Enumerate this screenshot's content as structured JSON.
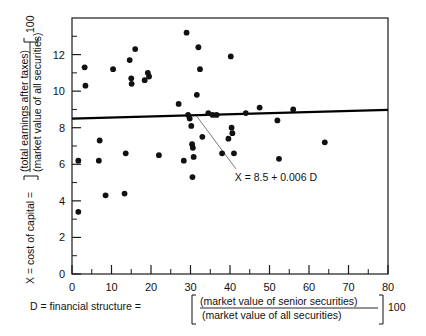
{
  "figure": {
    "title": "",
    "y_axis_label_prefix": "X = cost of capital =",
    "y_axis_numerator": "(total earnings after taxes)",
    "y_axis_denominator": "(market value of all securities)",
    "y_axis_multiplier": "100",
    "x_axis_label_prefix": "D = financial structure =",
    "x_axis_numerator": "(market value of senior securities)",
    "x_axis_denominator": "(market value of all securities)",
    "x_axis_multiplier": "100",
    "regression_annotation": "X = 8.5 + 0.006 D"
  },
  "chart_data": {
    "type": "scatter",
    "title": "",
    "xlabel": "D = financial structure = [(market value of senior securities)/(market value of all securities)] 100",
    "ylabel": "X = cost of capital = [(total earnings after taxes)/(market value of all securities)] 100",
    "xlim": [
      0,
      80
    ],
    "ylim": [
      0,
      14
    ],
    "xticks": [
      0,
      10,
      20,
      30,
      40,
      50,
      60,
      70,
      80
    ],
    "xticks_minor": [
      5,
      15,
      25,
      35,
      45,
      55,
      65,
      75
    ],
    "yticks": [
      0,
      2,
      4,
      6,
      8,
      10,
      12
    ],
    "yticks_minor": [
      1,
      3,
      5,
      7,
      9,
      11,
      13
    ],
    "grid": false,
    "legend": "none",
    "points": [
      [
        1.6,
        3.4
      ],
      [
        1.6,
        6.2
      ],
      [
        3.2,
        11.3
      ],
      [
        3.4,
        10.3
      ],
      [
        6.8,
        6.2
      ],
      [
        7.0,
        7.3
      ],
      [
        8.5,
        4.3
      ],
      [
        10.4,
        11.2
      ],
      [
        13.3,
        4.4
      ],
      [
        13.6,
        6.6
      ],
      [
        14.6,
        11.7
      ],
      [
        15.0,
        10.7
      ],
      [
        15.1,
        10.4
      ],
      [
        16.0,
        12.3
      ],
      [
        18.4,
        10.6
      ],
      [
        19.2,
        11.0
      ],
      [
        19.5,
        10.8
      ],
      [
        22.0,
        6.5
      ],
      [
        27.0,
        9.3
      ],
      [
        28.3,
        6.2
      ],
      [
        29.0,
        13.2
      ],
      [
        29.4,
        8.7
      ],
      [
        29.8,
        8.5
      ],
      [
        30.2,
        8.1
      ],
      [
        30.4,
        7.1
      ],
      [
        30.6,
        6.9
      ],
      [
        30.8,
        6.4
      ],
      [
        30.5,
        5.3
      ],
      [
        31.6,
        9.8
      ],
      [
        32.0,
        12.4
      ],
      [
        32.4,
        11.2
      ],
      [
        33.0,
        7.5
      ],
      [
        34.5,
        8.8
      ],
      [
        35.6,
        8.7
      ],
      [
        36.6,
        8.7
      ],
      [
        38.0,
        6.6
      ],
      [
        39.6,
        7.4
      ],
      [
        40.2,
        11.9
      ],
      [
        40.4,
        8.0
      ],
      [
        40.6,
        7.7
      ],
      [
        41.0,
        6.6
      ],
      [
        44.0,
        8.8
      ],
      [
        47.5,
        9.1
      ],
      [
        52.0,
        8.4
      ],
      [
        52.4,
        6.3
      ],
      [
        56.0,
        9.0
      ],
      [
        64.0,
        7.2
      ]
    ],
    "fit_line": {
      "equation": "X = 8.5 + 0.006 D",
      "intercept": 8.5,
      "slope": 0.006,
      "x_start": 0,
      "x_end": 80
    }
  }
}
